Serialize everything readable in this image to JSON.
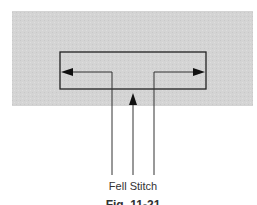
{
  "figure": {
    "background_panel_color": "#d4d4d4",
    "line_color": "#222222",
    "label": "Fell Stitch",
    "caption": "Fig. 11-21"
  }
}
